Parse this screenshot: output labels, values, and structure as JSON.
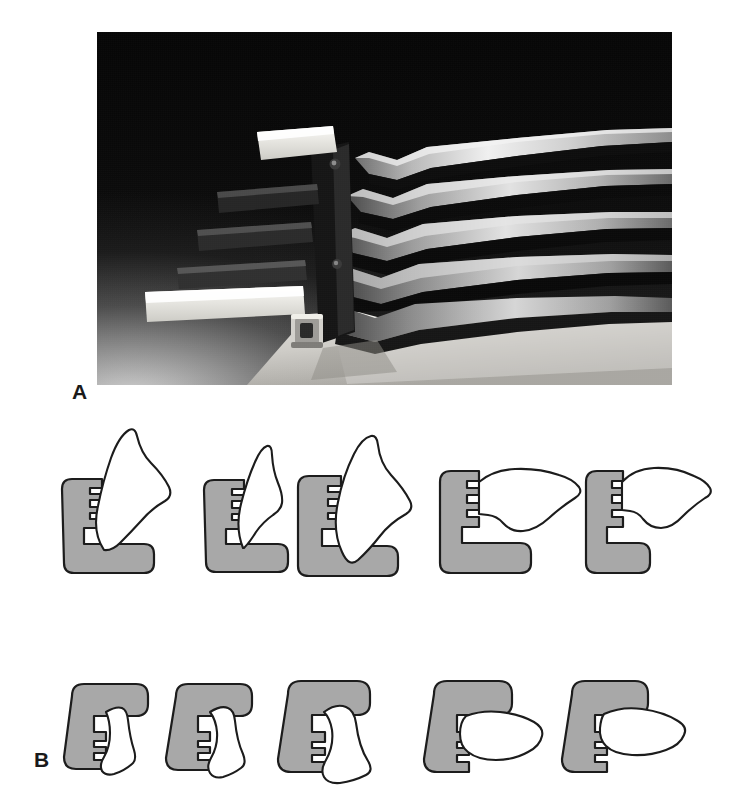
{
  "figure": {
    "kind": "two-panel scientific figure",
    "background_color": "#ffffff",
    "width": 729,
    "height": 789
  },
  "panels": [
    {
      "id": "A",
      "label": "A",
      "type": "photograph",
      "caption_text": "",
      "photo": {
        "subject": "stacked set of five angled metal surgical instrument blades joined at a hinged pivot block",
        "background_description": "dark studio backdrop with light gradient rising from lower-left",
        "dominant_colors": {
          "backdrop_dark": "#0b0b0b",
          "backdrop_light": "#d9d9d9",
          "metal_highlight": "#e8e8e8",
          "metal_midtone": "#8a8a8a",
          "metal_shadow": "#101010",
          "white_handle": "#f2f0ea",
          "base_plate": "#c9c7c2"
        },
        "blade_count": 5,
        "handle_tabs": 5
      }
    },
    {
      "id": "B",
      "label": "B",
      "type": "line-diagram-row-pair",
      "caption_text": ""
    }
  ],
  "diagram_rows": [
    {
      "row_id": "row-a",
      "belongs_to_panel": "A",
      "orientation": "upward / L-shaped seat open at top-right",
      "item_count": 5,
      "items": [
        {
          "name": "diagram-a-1",
          "bracket": "L-shape",
          "profile": "tall upright blade, broad waisted tip, steeply inclined",
          "tilt_deg": 14
        },
        {
          "name": "diagram-a-2",
          "bracket": "L-shape",
          "profile": "narrow upright blade, slender pointed tip",
          "tilt_deg": 12
        },
        {
          "name": "diagram-a-3",
          "bracket": "L-shape",
          "profile": "tall wide blade, strongly flared crown",
          "tilt_deg": 10
        },
        {
          "name": "diagram-a-4",
          "bracket": "L-shape",
          "profile": "short horizontal blade, notched lower edge",
          "tilt_deg": 72
        },
        {
          "name": "diagram-a-5",
          "bracket": "L-shape",
          "profile": "short horizontal blade, slimmer waist and notch",
          "tilt_deg": 76
        }
      ]
    },
    {
      "row_id": "row-b",
      "belongs_to_panel": "B",
      "orientation": "downward / C-shaped seat open at bottom-right",
      "item_count": 5,
      "items": [
        {
          "name": "diagram-b-1",
          "bracket": "C-shape",
          "profile": "narrow tapered blade hanging down-right",
          "tilt_deg": 20
        },
        {
          "name": "diagram-b-2",
          "bracket": "C-shape",
          "profile": "tapered blade with flared scalloped lower edge",
          "tilt_deg": 22
        },
        {
          "name": "diagram-b-3",
          "bracket": "C-shape",
          "profile": "broad bulbous blade with wavy base",
          "tilt_deg": 18
        },
        {
          "name": "diagram-b-4",
          "bracket": "C-shape",
          "profile": "wide horizontal blade with undulating outline",
          "tilt_deg": 74
        },
        {
          "name": "diagram-b-5",
          "bracket": "C-shape",
          "profile": "wide horizontal blade, tapering distal end",
          "tilt_deg": 78
        }
      ]
    }
  ],
  "style_tokens": {
    "bracket_fill": "#a8a8a8",
    "bracket_stroke": "#1c1c1c",
    "blade_fill": "#ffffff",
    "blade_stroke": "#1c1c1c",
    "label_color": "#1a1a1a",
    "page_background": "#ffffff"
  }
}
